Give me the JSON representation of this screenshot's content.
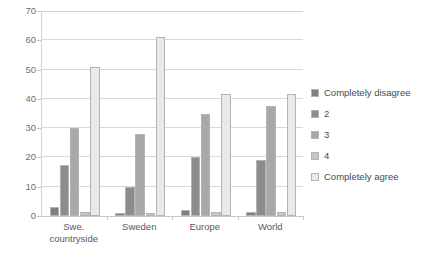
{
  "chart_data": {
    "type": "bar",
    "title": "",
    "subtitle": "",
    "xlabel": "",
    "ylabel": "",
    "categories": [
      "Swe. countryside",
      "Sweden",
      "Europe",
      "World"
    ],
    "category_lines": [
      [
        "Swe.",
        "countryside"
      ],
      [
        "Sweden"
      ],
      [
        "Europe"
      ],
      [
        "World"
      ]
    ],
    "series": [
      {
        "name": "Completely disagree",
        "color": "#7f7f7f",
        "values": [
          3,
          1,
          2,
          1.5
        ]
      },
      {
        "name": "2",
        "color": "#8c8c8c",
        "values": [
          17.5,
          10,
          20,
          19
        ]
      },
      {
        "name": "3",
        "color": "#a8a8a8",
        "values": [
          30,
          28,
          35,
          37.5
        ]
      },
      {
        "name": "4",
        "color": "#c6c6c4",
        "values": [
          1.5,
          1,
          1.5,
          1.5
        ]
      },
      {
        "name": "Completely agree",
        "color": "#e9e9e6",
        "values": [
          51,
          61,
          41.5,
          41.5
        ]
      }
    ],
    "ylim": [
      0,
      70
    ],
    "yticks": [
      0,
      10,
      20,
      30,
      40,
      50,
      60,
      70
    ],
    "ytick_labels": [
      "0",
      "10",
      "20",
      "30",
      "40",
      "50",
      "60",
      "70"
    ],
    "grid": true,
    "grid_axis": "y",
    "legend_position": "right",
    "legend_entries": [
      "Completely disagree",
      "2",
      "3",
      "4",
      "Completely agree"
    ],
    "annotations": [],
    "axis_color": "#d3d3d3",
    "gridline_color": "#d8d8d8",
    "tick_label_color": "#6f6f6f",
    "background_color": "#ffffff"
  }
}
